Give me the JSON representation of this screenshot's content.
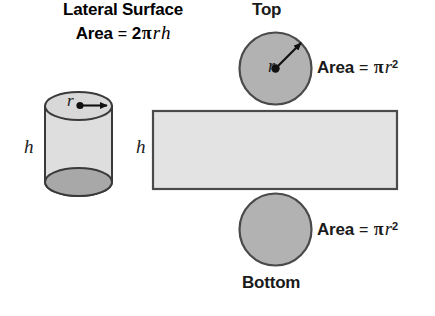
{
  "figure": {
    "colors": {
      "fill_light": "#e0e0e0",
      "fill_mid": "#b5b5b5",
      "fill_dark": "#9a9a9a",
      "stroke": "#3a3a3a",
      "text": "#1a1a1a",
      "background": "#ffffff"
    }
  },
  "labels": {
    "top": "Top",
    "bottom": "Bottom",
    "height_cylinder": "h",
    "height_rectangle": "h",
    "radius_cylinder": "r",
    "radius_circle": "r",
    "lateral_surface": "Lateral Surface"
  },
  "formulas": {
    "circle_area": {
      "lhs": "Area",
      "eq": "=",
      "coefficient": "",
      "pi": "π",
      "variable": "r",
      "exponent": "2",
      "full": "Area = πr²"
    },
    "lateral_area": {
      "lhs": "Area",
      "eq": "=",
      "coefficient": "2",
      "pi": "π",
      "variable": "r",
      "variable2": "h",
      "full": "Area = 2πrh"
    }
  },
  "shapes": {
    "cylinder_3d": {
      "name": "cylinder",
      "left": 45,
      "top": 92,
      "width": 67,
      "height": 104
    },
    "top_circle": {
      "name": "top-circle",
      "cx": 275.5,
      "cy": 68.5,
      "r": 36.5
    },
    "bottom_circle": {
      "name": "bottom-circle",
      "cx": 275.5,
      "cy": 229.5,
      "r": 36.5
    },
    "lateral_rectangle": {
      "name": "lateral-rectangle",
      "x": 152,
      "y": 110,
      "width": 246,
      "height": 80
    }
  }
}
